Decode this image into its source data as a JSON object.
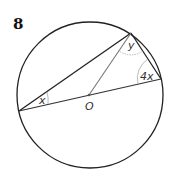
{
  "question_number": "8",
  "points": {
    "center_label": "O"
  },
  "angles": {
    "at_left": "x",
    "at_top": "y",
    "at_right": "4x"
  },
  "colors": {
    "circle": "#222222",
    "chord": "#222222",
    "radius": "#666666",
    "arc": "#aaaaaa",
    "text": "#333333"
  }
}
